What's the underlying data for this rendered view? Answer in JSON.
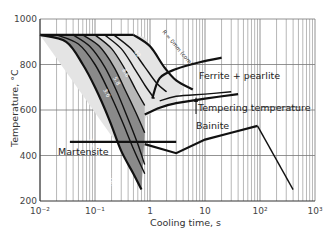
{
  "chart_data": {
    "type": "line",
    "title": "",
    "xlabel": "Cooling time, s",
    "ylabel": "Temperature, °C",
    "x_scale": "log",
    "xlim": [
      0.01,
      1000
    ],
    "ylim": [
      200,
      1000
    ],
    "x_ticks": [
      "10⁻²",
      "10⁻¹",
      "1",
      "10",
      "10²",
      "10³"
    ],
    "y_ticks": [
      "200",
      "400",
      "600",
      "800",
      "1000"
    ],
    "grid": true,
    "austenitizing_temperature": 930,
    "regions": [
      {
        "name": "Ferrite + pearlite",
        "label": "Ferrite + pearlite"
      },
      {
        "name": "Bainite",
        "label": "Bainite"
      },
      {
        "name": "Martensite",
        "label": "Martensite"
      },
      {
        "name": "Tempering temperature",
        "label": "Tempering temperature"
      }
    ],
    "cooling_curves": [
      {
        "name": "surface",
        "label": "R = 0mm (surface)",
        "points": [
          [
            0.01,
            930
          ],
          [
            0.03,
            900
          ],
          [
            0.06,
            800
          ],
          [
            0.1,
            700
          ],
          [
            0.18,
            560
          ],
          [
            0.3,
            420
          ],
          [
            0.5,
            320
          ],
          [
            0.7,
            250
          ]
        ]
      },
      {
        "name": "curve-2",
        "label": "3.6",
        "points": [
          [
            0.02,
            930
          ],
          [
            0.05,
            890
          ],
          [
            0.1,
            800
          ],
          [
            0.18,
            680
          ],
          [
            0.3,
            560
          ],
          [
            0.5,
            430
          ],
          [
            0.8,
            320
          ]
        ]
      },
      {
        "name": "curve-3",
        "label": "5.8",
        "points": [
          [
            0.04,
            930
          ],
          [
            0.08,
            880
          ],
          [
            0.15,
            790
          ],
          [
            0.25,
            680
          ],
          [
            0.4,
            560
          ],
          [
            0.6,
            450
          ],
          [
            0.8,
            360
          ]
        ]
      },
      {
        "name": "curve-4",
        "label": "8.6",
        "points": [
          [
            0.06,
            930
          ],
          [
            0.12,
            880
          ],
          [
            0.22,
            790
          ],
          [
            0.35,
            690
          ],
          [
            0.55,
            590
          ],
          [
            0.8,
            500
          ]
        ]
      },
      {
        "name": "curve-5",
        "label": "12",
        "points": [
          [
            0.1,
            930
          ],
          [
            0.2,
            870
          ],
          [
            0.35,
            780
          ],
          [
            0.55,
            690
          ],
          [
            0.8,
            620
          ]
        ]
      },
      {
        "name": "curve-6",
        "label": "17",
        "points": [
          [
            0.15,
            930
          ],
          [
            0.3,
            870
          ],
          [
            0.5,
            790
          ],
          [
            0.8,
            710
          ],
          [
            1.2,
            650
          ]
        ]
      },
      {
        "name": "curve-7",
        "label": "22",
        "points": [
          [
            0.22,
            930
          ],
          [
            0.45,
            870
          ],
          [
            0.8,
            790
          ],
          [
            1.3,
            720
          ],
          [
            2,
            680
          ]
        ]
      },
      {
        "name": "core",
        "label": "R = 0mm (core)",
        "points": [
          [
            0.5,
            930
          ],
          [
            1,
            880
          ],
          [
            1.8,
            790
          ],
          [
            3,
            730
          ],
          [
            6,
            690
          ]
        ]
      }
    ],
    "transformation_boundaries": {
      "ferrite_pearlite_start": [
        [
          1.1,
          650
        ],
        [
          1.5,
          740
        ],
        [
          3,
          780
        ],
        [
          8,
          810
        ],
        [
          20,
          830
        ]
      ],
      "ferrite_pearlite_lower": [
        [
          1.5,
          640
        ],
        [
          3,
          660
        ],
        [
          10,
          670
        ],
        [
          30,
          680
        ]
      ],
      "bainite_upper": [
        [
          0.8,
          580
        ],
        [
          1.5,
          610
        ],
        [
          3,
          630
        ],
        [
          10,
          650
        ],
        [
          40,
          670
        ]
      ],
      "bainite_lower": [
        [
          0.8,
          450
        ],
        [
          3,
          410
        ],
        [
          10,
          470
        ],
        [
          30,
          500
        ],
        [
          90,
          530
        ]
      ],
      "martensite_start": [
        [
          0.035,
          460
        ],
        [
          3,
          460
        ]
      ],
      "tail": [
        [
          90,
          530
        ],
        [
          400,
          250
        ]
      ]
    }
  }
}
